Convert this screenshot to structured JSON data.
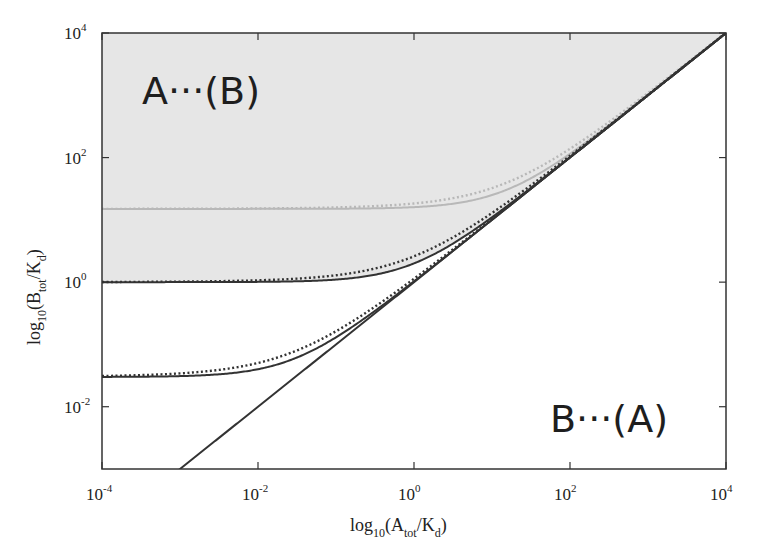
{
  "chart_data": {
    "type": "line",
    "title": "",
    "xlabel": "log10(A_tot/K_d)",
    "ylabel": "log10(B_tot/K_d)",
    "xlabel_parts": {
      "base": "log",
      "sub1": "10",
      "open": "(A",
      "sub2": "tot",
      "mid": "/K",
      "sub3": "d",
      "close": ")"
    },
    "ylabel_parts": {
      "base": "log",
      "sub1": "10",
      "open": "(B",
      "sub2": "tot",
      "mid": "/K",
      "sub3": "d",
      "close": ")"
    },
    "xscale": "log",
    "yscale": "log",
    "xlim": [
      0.0001,
      10000
    ],
    "ylim": [
      0.001,
      10000
    ],
    "x_ticks": [
      {
        "base": "10",
        "exp": "-4",
        "value": 0.0001
      },
      {
        "base": "10",
        "exp": "-2",
        "value": 0.01
      },
      {
        "base": "10",
        "exp": "0",
        "value": 1
      },
      {
        "base": "10",
        "exp": "2",
        "value": 100
      },
      {
        "base": "10",
        "exp": "4",
        "value": 10000
      }
    ],
    "y_ticks": [
      {
        "base": "10",
        "exp": "-2",
        "value": 0.01
      },
      {
        "base": "10",
        "exp": "0",
        "value": 1
      },
      {
        "base": "10",
        "exp": "2",
        "value": 100
      },
      {
        "base": "10",
        "exp": "4",
        "value": 10000
      }
    ],
    "grid": false,
    "legend": null,
    "annotations": [
      {
        "text": "A···(B)",
        "position": "upper-left",
        "region": "shaded"
      },
      {
        "text": "B···(A)",
        "position": "lower-right",
        "region": "unshaded"
      }
    ],
    "shaded_region": {
      "description": "area above the B0=1 solid curve, below diagonal B=A",
      "color": "#e6e6e6"
    },
    "series": [
      {
        "name": "B0=15 solid",
        "style": "solid",
        "color": "#b8b8b8",
        "B0": 15
      },
      {
        "name": "B0=15 dotted",
        "style": "dotted",
        "color": "#b8b8b8",
        "B0": 15
      },
      {
        "name": "B0=1 solid",
        "style": "solid",
        "color": "#333333",
        "B0": 1
      },
      {
        "name": "B0=1 dotted",
        "style": "dotted",
        "color": "#333333",
        "B0": 1
      },
      {
        "name": "B0=0.03 solid",
        "style": "solid",
        "color": "#333333",
        "B0": 0.03
      },
      {
        "name": "B0=0.03 dotted",
        "style": "dotted",
        "color": "#333333",
        "B0": 0.03
      },
      {
        "name": "diagonal B=A",
        "style": "solid",
        "color": "#333333"
      }
    ],
    "x_sample": [
      0.0001,
      0.001,
      0.01,
      0.1,
      1,
      10,
      100,
      1000,
      10000
    ],
    "y_values_B0_0p03_solid": [
      0.0301,
      0.031,
      0.04,
      0.13,
      1.03,
      10.03,
      100.03,
      1000.03,
      10000.03
    ],
    "y_values_B0_1_solid": [
      1.0001,
      1.001,
      1.01,
      1.1,
      2,
      11,
      101,
      1001,
      10001
    ],
    "y_values_B0_15_solid": [
      15.0001,
      15.001,
      15.01,
      15.1,
      16,
      25,
      115,
      1015,
      10015
    ]
  },
  "labels": {
    "region_top": "A···(B)",
    "region_bottom": "B···(A)"
  }
}
